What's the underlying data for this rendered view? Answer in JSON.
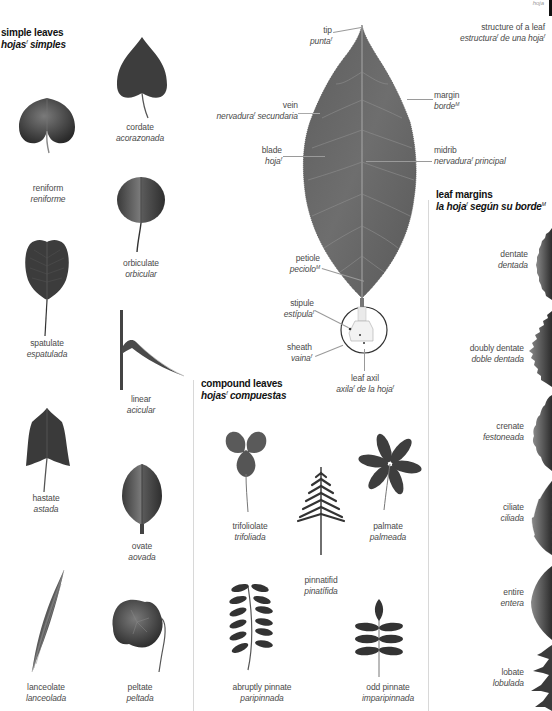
{
  "page": {
    "corner_text": "hoja",
    "colors": {
      "leaf_dark": "#3a3a3a",
      "leaf_mid": "#6a6a6a",
      "text": "#4a4a4a",
      "title": "#111111",
      "divider": "#d8d8d8"
    }
  },
  "simple_leaves": {
    "title_en": "simple leaves",
    "title_es": "hojas",
    "title_es_gender": "f",
    "title_es_rest": "simples",
    "items": [
      {
        "en": "cordate",
        "es": "acorazonada",
        "icon": "cordate-leaf-icon"
      },
      {
        "en": "reniform",
        "es": "reniforme",
        "icon": "reniform-leaf-icon"
      },
      {
        "en": "orbiculate",
        "es": "orbicular",
        "icon": "orbiculate-leaf-icon"
      },
      {
        "en": "spatulate",
        "es": "espatulada",
        "icon": "spatulate-leaf-icon"
      },
      {
        "en": "linear",
        "es": "acicular",
        "icon": "linear-leaf-icon"
      },
      {
        "en": "hastate",
        "es": "astada",
        "icon": "hastate-leaf-icon"
      },
      {
        "en": "ovate",
        "es": "aovada",
        "icon": "ovate-leaf-icon"
      },
      {
        "en": "lanceolate",
        "es": "lanceolada",
        "icon": "lanceolate-leaf-icon"
      },
      {
        "en": "peltate",
        "es": "peltada",
        "icon": "peltate-leaf-icon"
      }
    ]
  },
  "structure": {
    "title_en": "structure of a leaf",
    "title_es_a": "estructura",
    "title_es_a_gender": "f",
    "title_es_b": "de una hoja",
    "title_es_b_gender": "f",
    "parts": [
      {
        "en": "tip",
        "es": "punta",
        "gender": "f"
      },
      {
        "en": "vein",
        "es": "nervadura",
        "gender": "f",
        "es_suffix": "secundaria"
      },
      {
        "en": "margin",
        "es": "borde",
        "gender": "M"
      },
      {
        "en": "blade",
        "es": "hoja",
        "gender": "f"
      },
      {
        "en": "midrib",
        "es": "nervadura",
        "gender": "f",
        "es_suffix": "principal"
      },
      {
        "en": "petiole",
        "es": "peciolo",
        "gender": "M"
      },
      {
        "en": "stipule",
        "es": "estípula",
        "gender": "f"
      },
      {
        "en": "sheath",
        "es": "vaina",
        "gender": "f"
      },
      {
        "en": "leaf axil",
        "es": "axila",
        "gender": "f",
        "es_suffix": "de la hoja",
        "suffix_gender": "f"
      }
    ]
  },
  "compound_leaves": {
    "title_en": "compound leaves",
    "title_es": "hojas",
    "title_es_gender": "f",
    "title_es_rest": "compuestas",
    "items": [
      {
        "en": "trifoliolate",
        "es": "trifoliada",
        "icon": "trifoliolate-leaf-icon"
      },
      {
        "en": "palmate",
        "es": "palmeada",
        "icon": "palmate-leaf-icon"
      },
      {
        "en": "pinnatifid",
        "es": "pinatífida",
        "icon": "pinnatifid-leaf-icon"
      },
      {
        "en": "abruptly pinnate",
        "es": "paripinnada",
        "icon": "abruptly-pinnate-leaf-icon"
      },
      {
        "en": "odd pinnate",
        "es": "imparipinnada",
        "icon": "odd-pinnate-leaf-icon"
      }
    ]
  },
  "leaf_margins": {
    "title_en": "leaf margins",
    "title_es_a": "la hoja",
    "title_es_a_gender": "f",
    "title_es_b": "según su borde",
    "title_es_b_gender": "M",
    "items": [
      {
        "en": "dentate",
        "es": "dentada",
        "icon": "dentate-margin-icon"
      },
      {
        "en": "doubly dentate",
        "es": "doble dentada",
        "icon": "doubly-dentate-margin-icon"
      },
      {
        "en": "crenate",
        "es": "festoneada",
        "icon": "crenate-margin-icon"
      },
      {
        "en": "ciliate",
        "es": "ciliada",
        "icon": "ciliate-margin-icon"
      },
      {
        "en": "entire",
        "es": "entera",
        "icon": "entire-margin-icon"
      },
      {
        "en": "lobate",
        "es": "lobulada",
        "icon": "lobate-margin-icon"
      }
    ]
  }
}
